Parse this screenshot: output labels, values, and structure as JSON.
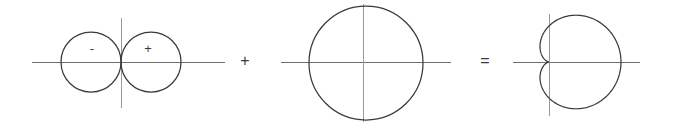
{
  "figure": {
    "kind": "polar-curve-decomposition",
    "width": 673,
    "height": 127,
    "background_color": "#ffffff",
    "curve_color": "#3a3a3a",
    "axis_color": "#6e6e6e",
    "axis_vertical_color": "#9a9a9a",
    "equation_reading": "cos-theta plus one equals one plus cos-theta"
  },
  "operators": {
    "plus": "+",
    "equals": "="
  },
  "terms": {
    "first": {
      "name": "dipole-two-tangent-circles",
      "lobe_negative_label": "-",
      "lobe_positive_label": "+",
      "axis": {
        "horizontal_x1": 32,
        "horizontal_x2": 225,
        "horizontal_y": 62,
        "vertical_x": 121,
        "vertical_y1": 18,
        "vertical_y2": 108
      },
      "circles": [
        {
          "name": "negative-lobe",
          "cx": 91,
          "cy": 62,
          "r": 30
        },
        {
          "name": "positive-lobe",
          "cx": 151,
          "cy": 62,
          "r": 30
        }
      ],
      "label_positions": [
        {
          "text": "-",
          "x": 92,
          "y": 50
        },
        {
          "text": "+",
          "x": 148,
          "y": 50
        }
      ]
    },
    "second": {
      "name": "unit-circle",
      "axis": {
        "horizontal_x1": 281,
        "horizontal_x2": 451,
        "horizontal_y": 62,
        "vertical_x": 363,
        "vertical_y1": 4,
        "vertical_y2": 122
      },
      "circle": {
        "name": "constant-radius-circle",
        "cx": 366,
        "cy": 63,
        "r": 57
      }
    },
    "third": {
      "name": "cardioid",
      "axis": {
        "horizontal_x1": 513,
        "horizontal_x2": 640,
        "horizontal_y": 62,
        "vertical_x": 549,
        "vertical_y1": 14,
        "vertical_y2": 116
      },
      "cardioid_params": {
        "cusp_x": 549,
        "cusp_y": 62,
        "a": 36,
        "formula": "r = a(1 + cos theta)",
        "rightmost_x": 621
      }
    }
  },
  "operator_positions": {
    "plus": {
      "x": 245,
      "y": 62
    },
    "equals": {
      "x": 485,
      "y": 62
    }
  }
}
